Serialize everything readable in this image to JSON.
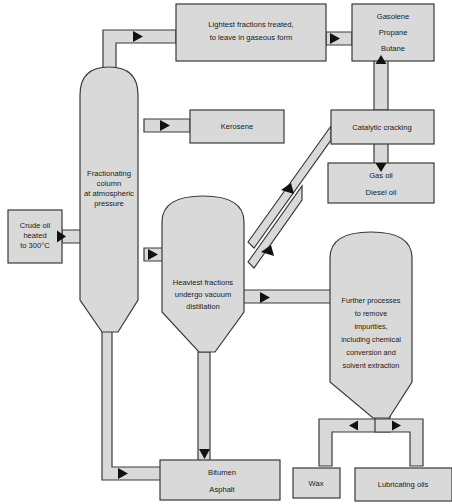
{
  "diagram": {
    "colors": {
      "fill": "#d9d9d9",
      "stroke": "#3a3a3a",
      "arrow": "#111111",
      "background": "#ffffff"
    },
    "nodes": {
      "crude_oil": {
        "lines": [
          "Crude oil",
          "heated",
          "to 300°C"
        ]
      },
      "column": {
        "lines": [
          "Fractionating",
          "column",
          "at atmospheric",
          "pressure"
        ]
      },
      "lightest": {
        "lines": [
          "Lightest fractions treated,",
          "to leave in gaseous form"
        ]
      },
      "gases": {
        "lines": [
          "Gasolene",
          "Propane",
          "Butane"
        ]
      },
      "kerosene": {
        "lines": [
          "Kerosene"
        ]
      },
      "catalytic": {
        "lines": [
          "Catalytic cracking"
        ]
      },
      "gas_oil": {
        "lines": [
          "Gas oil",
          "Diesel oil"
        ]
      },
      "vacuum": {
        "lines": [
          "Heaviest fractions",
          "undergo vacuum",
          "distillation"
        ]
      },
      "further": {
        "lines": [
          "Further processes",
          "to remove",
          "impurities,",
          "including chemical",
          "conversion and",
          "solvent extraction"
        ]
      },
      "bitumen": {
        "lines": [
          "Bitumen",
          "Asphalt"
        ]
      },
      "wax": {
        "lines": [
          "Wax"
        ]
      },
      "lubricating": {
        "lines": [
          "Lubricating oils"
        ]
      }
    }
  }
}
